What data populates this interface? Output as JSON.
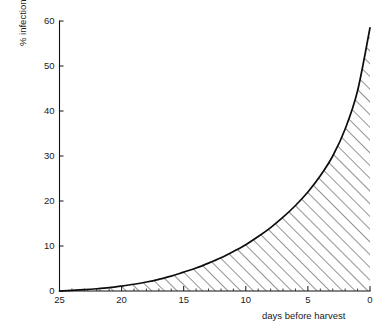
{
  "chart_data": {
    "type": "area",
    "title": "",
    "subtitle": "",
    "xlabel": "days before harvest",
    "ylabel": "% infection",
    "xlim": [
      25,
      0
    ],
    "ylim": [
      0,
      60
    ],
    "x_ticks": [
      25,
      20,
      15,
      10,
      5,
      0
    ],
    "x_tick_labels": [
      "25",
      "20",
      "15",
      "10",
      "5",
      "0"
    ],
    "x_minor_tick_step": 1,
    "y_ticks": [
      0,
      10,
      20,
      30,
      40,
      50,
      60
    ],
    "y_tick_labels": [
      "0",
      "10",
      "20",
      "30",
      "40",
      "50",
      "60"
    ],
    "grid": false,
    "legend": null,
    "fill_style": "diagonal-hatch",
    "series": [
      {
        "name": "% infection",
        "x": [
          25,
          24,
          23,
          22,
          21,
          20,
          19,
          18,
          17,
          16,
          15,
          14,
          13,
          12,
          11,
          10,
          9,
          8,
          7,
          6,
          5,
          4,
          3,
          2,
          1,
          0
        ],
        "y": [
          0.0,
          0.15,
          0.3,
          0.5,
          0.75,
          1.1,
          1.5,
          2.0,
          2.6,
          3.3,
          4.2,
          5.1,
          6.2,
          7.4,
          8.8,
          10.3,
          12.1,
          14.1,
          16.4,
          19.0,
          22.0,
          25.6,
          30.0,
          36.0,
          44.5,
          58.5
        ]
      }
    ],
    "annotations": []
  },
  "labels": {
    "y_axis_title": "% infection",
    "x_axis_title": "days before harvest"
  }
}
